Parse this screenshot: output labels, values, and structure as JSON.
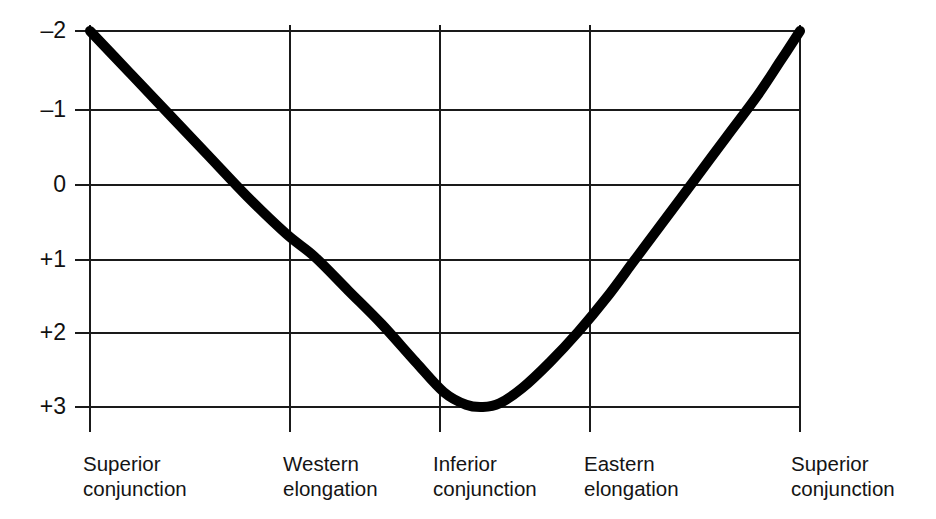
{
  "chart_data": {
    "type": "line",
    "title": "",
    "subtitle": "",
    "xlabel": "",
    "ylabel": "",
    "grid": true,
    "legend": "none",
    "y_axis_inverted": true,
    "ylim": [
      -2,
      3
    ],
    "yticks": [
      -2,
      -1,
      0,
      1,
      2,
      3
    ],
    "ytick_labels": [
      "–2",
      "–1",
      "0",
      "+1",
      "+2",
      "+3"
    ],
    "x_categories": [
      "Superior conjunction",
      "Western elongation",
      "Inferior conjunction",
      "Eastern elongation",
      "Superior conjunction"
    ],
    "xtick_labels": [
      {
        "line1": "Superior",
        "line2": "conjunction"
      },
      {
        "line1": "Western",
        "line2": "elongation"
      },
      {
        "line1": "Inferior",
        "line2": "conjunction"
      },
      {
        "line1": "Eastern",
        "line2": "elongation"
      },
      {
        "line1": "Superior",
        "line2": "conjunction"
      }
    ],
    "series": [
      {
        "name": "magnitude",
        "values": [
          -2.0,
          -1.45,
          -0.9,
          -0.35,
          0.2,
          0.7,
          1.0,
          1.45,
          1.9,
          2.4,
          2.8,
          2.97,
          3.0,
          2.95,
          2.75,
          2.4,
          2.0,
          1.55,
          1.05,
          0.55,
          0.0,
          -0.6,
          -1.15,
          -1.6,
          -2.0
        ],
        "x": [
          0.0,
          0.28,
          0.56,
          0.84,
          1.12,
          1.4,
          1.6,
          1.84,
          2.08,
          2.32,
          2.52,
          2.68,
          2.8,
          2.92,
          3.08,
          3.28,
          3.48,
          3.68,
          3.88,
          4.08,
          4.3,
          4.54,
          4.76,
          4.92,
          5.06
        ],
        "color": "#000000",
        "line_width": 10
      }
    ],
    "xlim": [
      0,
      5.06
    ],
    "note_curve_key_points": {
      "start_superior_conjunction": -2.0,
      "western_elongation": 1.0,
      "inferior_conjunction_peak": 3.0,
      "eastern_elongation": 1.0,
      "end_superior_conjunction": -2.0
    }
  },
  "axes": {
    "left_x": 90,
    "right_x": 800,
    "top_y": 31,
    "bottom_y": 407,
    "vertical_gridlines_x": [
      90,
      290,
      440,
      590,
      800
    ],
    "horizontal_gridlines_y": [
      31,
      110,
      185,
      260,
      333,
      407
    ],
    "axis_color": "#1a1a1a",
    "line_color": "#000000",
    "background": "#ffffff"
  }
}
